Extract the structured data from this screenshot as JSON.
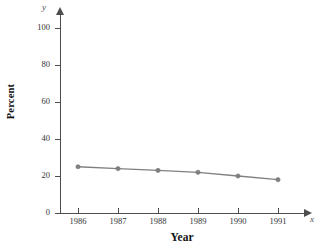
{
  "chart_data": {
    "type": "line",
    "title": "",
    "xlabel": "Year",
    "ylabel": "Percent",
    "x_axis_variable": "x",
    "y_axis_variable": "y",
    "categories": [
      "1986",
      "1987",
      "1988",
      "1989",
      "1990",
      "1991"
    ],
    "values": [
      25,
      24,
      23,
      22,
      20,
      18
    ],
    "series": [
      {
        "name": "Percent",
        "values": [
          25,
          24,
          23,
          22,
          20,
          18
        ]
      }
    ],
    "ylim": [
      0,
      100
    ],
    "y_ticks": [
      0,
      20,
      40,
      60,
      80,
      100
    ],
    "y_tick_labels": [
      "0",
      "20",
      "40",
      "60",
      "80",
      "100"
    ],
    "x_ticks": [
      "1986",
      "1987",
      "1988",
      "1989",
      "1990",
      "1991"
    ],
    "grid": false,
    "legend": false,
    "legend_position": "none",
    "marker": "circle",
    "line_color": "#808080",
    "marker_color": "#808080",
    "axis_color": "#4d4d4d",
    "background_color": "#ffffff"
  }
}
